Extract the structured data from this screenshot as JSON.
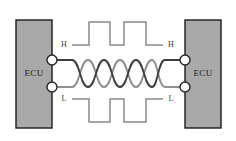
{
  "diagram": {
    "type": "schematic",
    "canvas": {
      "width": 236,
      "height": 141,
      "background": "#ffffff"
    },
    "colors": {
      "ecu_fill": "#a9a9a9",
      "ecu_border": "#1c1c1c",
      "wire_high": "#3c3c3c",
      "wire_low": "#8e8e8e",
      "waveform": "#8a8a8a",
      "connector_fill": "#fdfdfd",
      "connector_border": "#262626",
      "text": "#1a1a1a"
    },
    "nodes": [
      {
        "id": "ecu-left",
        "label": "ECU",
        "x": 16,
        "y": 20,
        "width": 36,
        "height": 108
      },
      {
        "id": "ecu-right",
        "label": "ECU",
        "x": 185,
        "y": 20,
        "width": 36,
        "height": 108
      }
    ],
    "connectors": [
      {
        "id": "left-high",
        "cx": 52,
        "cy": 60,
        "r": 5
      },
      {
        "id": "left-low",
        "cx": 52,
        "cy": 87,
        "r": 5
      },
      {
        "id": "right-high",
        "cx": 185,
        "cy": 60,
        "r": 5
      },
      {
        "id": "right-low",
        "cx": 185,
        "cy": 87,
        "r": 5
      }
    ],
    "signal_labels": [
      {
        "id": "h-left",
        "text": "H",
        "x": 64,
        "y": 45
      },
      {
        "id": "h-right",
        "text": "H",
        "x": 171,
        "y": 45
      },
      {
        "id": "l-left",
        "text": "L",
        "x": 64,
        "y": 99
      },
      {
        "id": "l-right",
        "text": "L",
        "x": 171,
        "y": 99
      }
    ],
    "twisted_pair": {
      "crossings": 6,
      "start_x": 72,
      "end_x": 165,
      "top_y": 60,
      "bottom_y": 87,
      "wire_high_id": "CAN-H",
      "wire_low_id": "CAN-L"
    },
    "waveforms": [
      {
        "id": "can-h-waveform",
        "signal": "H",
        "polarity": "active-high",
        "baseline_y": 45,
        "peak_y": 22,
        "segments": "M 72 45 L 89 45 L 89 22 L 110 22 L 110 45 L 124 45 L 124 22 L 146 22 L 146 45 L 163 45"
      },
      {
        "id": "can-l-waveform",
        "signal": "L",
        "polarity": "active-low",
        "baseline_y": 99,
        "peak_y": 122,
        "segments": "M 72 99 L 89 99 L 89 122 L 110 122 L 110 99 L 124 99 L 124 122 L 146 122 L 146 99 L 163 99"
      }
    ]
  }
}
